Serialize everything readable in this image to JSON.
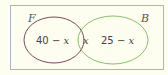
{
  "diagram": {
    "type": "venn",
    "frame": {
      "border_color": "#a9b4c6",
      "background": "#fdfdf0"
    },
    "sets": [
      {
        "label": "F",
        "color": "#7b4a63"
      },
      {
        "label": "B",
        "color": "#8dbf6e"
      }
    ],
    "regions": {
      "f_only": {
        "number": "40",
        "op": " − ",
        "var": "x"
      },
      "intersection": {
        "var": "x"
      },
      "b_only": {
        "number": "25",
        "op": " − ",
        "var": "x"
      }
    }
  }
}
